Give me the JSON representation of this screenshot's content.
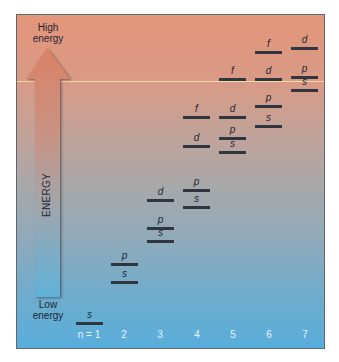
{
  "diagram": {
    "axis": {
      "label": "ENERGY",
      "top_label": "High energy",
      "top_label_lines": [
        "High",
        "energy"
      ],
      "bottom_label": "Low energy",
      "bottom_label_lines": [
        "Low",
        "energy"
      ]
    },
    "shell_labels": [
      "n = 1",
      "2",
      "3",
      "4",
      "5",
      "6",
      "7"
    ],
    "colors": {
      "top": "#e3967a",
      "middle": "#a7a8aa",
      "bottom": "#58aedc",
      "level_line": "#2f3640",
      "highlight_line": "#f6e2a4",
      "arrow_top": "#d98064",
      "arrow_bottom": "#5eb0d8"
    },
    "levels": [
      {
        "n": 1,
        "sub": "s",
        "y": 323
      },
      {
        "n": 2,
        "sub": "s",
        "y": 282
      },
      {
        "n": 2,
        "sub": "p",
        "y": 264
      },
      {
        "n": 3,
        "sub": "s",
        "y": 241
      },
      {
        "n": 3,
        "sub": "p",
        "y": 228
      },
      {
        "n": 3,
        "sub": "d",
        "y": 200
      },
      {
        "n": 4,
        "sub": "s",
        "y": 207
      },
      {
        "n": 4,
        "sub": "p",
        "y": 190
      },
      {
        "n": 4,
        "sub": "d",
        "y": 146
      },
      {
        "n": 4,
        "sub": "f",
        "y": 117
      },
      {
        "n": 5,
        "sub": "s",
        "y": 152
      },
      {
        "n": 5,
        "sub": "p",
        "y": 138
      },
      {
        "n": 5,
        "sub": "d",
        "y": 117
      },
      {
        "n": 5,
        "sub": "f",
        "y": 79
      },
      {
        "n": 6,
        "sub": "s",
        "y": 126
      },
      {
        "n": 6,
        "sub": "p",
        "y": 106
      },
      {
        "n": 6,
        "sub": "d",
        "y": 79
      },
      {
        "n": 6,
        "sub": "f",
        "y": 52
      },
      {
        "n": 7,
        "sub": "s",
        "y": 90
      },
      {
        "n": 7,
        "sub": "p",
        "y": 77
      },
      {
        "n": 7,
        "sub": "d",
        "y": 48
      }
    ]
  }
}
